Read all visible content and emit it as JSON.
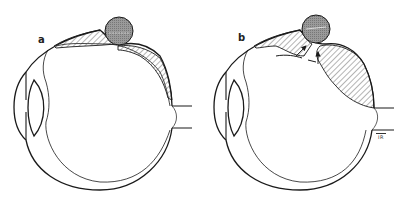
{
  "diagram": {
    "panels": [
      {
        "label": "a"
      },
      {
        "label": "b",
        "annotation": "IR"
      }
    ],
    "colors": {
      "stroke": "#1a1a1a",
      "buckle_fill": "#9a9a9a",
      "hatch": "#444444",
      "background": "#ffffff"
    }
  }
}
